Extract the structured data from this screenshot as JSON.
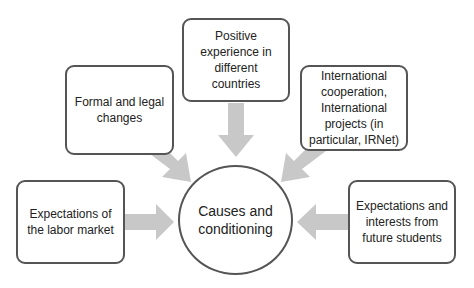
{
  "diagram": {
    "center": {
      "label": "Causes and\nconditioning"
    },
    "boxes": [
      {
        "id": "positive-experience",
        "label": "Positive\nexperience in\ndifferent\ncountries"
      },
      {
        "id": "formal-legal",
        "label": "Formal and legal\nchanges"
      },
      {
        "id": "international-cooperation",
        "label": "International\ncooperation,\nInternational\nprojects (in\nparticular, IRNet)"
      },
      {
        "id": "labor-market",
        "label": "Expectations of\nthe labor market"
      },
      {
        "id": "future-students",
        "label": "Expectations and\ninterests from\nfuture students"
      }
    ],
    "colors": {
      "border": "#555555",
      "arrow": "#c8c8c8",
      "text": "#222222"
    }
  }
}
